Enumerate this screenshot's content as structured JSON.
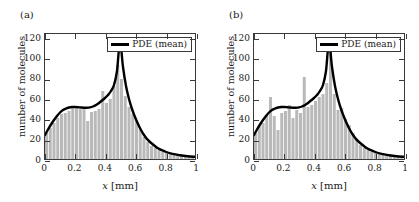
{
  "figure": {
    "background": "#ffffff",
    "bar_color": "#b9b9b9",
    "bar_edge_color": "#ffffff",
    "line_color": "#000000",
    "axis_color": "#3a3a3a"
  },
  "panels": [
    {
      "label": "(a)",
      "legend_label": "PDE (mean)"
    },
    {
      "label": "(b)",
      "legend_label": "PDE (mean)"
    }
  ],
  "chart_data": [
    {
      "type": "bar",
      "panel": "(a)",
      "title": "",
      "xlabel": "x [mm]",
      "ylabel": "number of molecules",
      "xlim": [
        0,
        1
      ],
      "ylim": [
        0,
        125
      ],
      "xticks": [
        0,
        0.2,
        0.4,
        0.6,
        0.8,
        1
      ],
      "xtick_labels": [
        "0",
        "0.2",
        "0.4",
        "0.6",
        "0.8",
        "1"
      ],
      "yticks": [
        0,
        20,
        40,
        60,
        80,
        100,
        120
      ],
      "ytick_labels": [
        "0",
        "20",
        "40",
        "60",
        "80",
        "100",
        "120"
      ],
      "grid": false,
      "legend_position": "top-right",
      "bin_width": 0.025,
      "bin_centers": [
        0.0125,
        0.0375,
        0.0625,
        0.0875,
        0.1125,
        0.1375,
        0.1625,
        0.1875,
        0.2125,
        0.2375,
        0.2625,
        0.2875,
        0.3125,
        0.3375,
        0.3625,
        0.3875,
        0.4125,
        0.4375,
        0.4625,
        0.4875,
        0.5125,
        0.5375,
        0.5625,
        0.5875,
        0.6125,
        0.6375,
        0.6625,
        0.6875,
        0.7125,
        0.7375,
        0.7625,
        0.7875,
        0.8125,
        0.8375,
        0.8625,
        0.8875,
        0.9125,
        0.9375,
        0.9625,
        0.9875
      ],
      "values": [
        26,
        31,
        36,
        41,
        45,
        46,
        48,
        52,
        53,
        50,
        50,
        38,
        47,
        48,
        50,
        68,
        56,
        60,
        73,
        94,
        80,
        63,
        52,
        45,
        38,
        30,
        22,
        17,
        13,
        11,
        9,
        7,
        6,
        6,
        5,
        4,
        4,
        3,
        3,
        3
      ],
      "series": [
        {
          "name": "PDE (mean)",
          "type": "line",
          "x": [
            0.0,
            0.02,
            0.04,
            0.06,
            0.08,
            0.1,
            0.12,
            0.14,
            0.16,
            0.18,
            0.2,
            0.22,
            0.24,
            0.26,
            0.28,
            0.3,
            0.32,
            0.34,
            0.36,
            0.38,
            0.4,
            0.42,
            0.44,
            0.46,
            0.48,
            0.5,
            0.52,
            0.54,
            0.56,
            0.58,
            0.6,
            0.62,
            0.64,
            0.66,
            0.68,
            0.7,
            0.75,
            0.8,
            0.85,
            0.9,
            0.95,
            1.0
          ],
          "y": [
            24,
            29.5,
            34.5,
            39,
            43,
            46.5,
            49,
            50.5,
            51.5,
            52,
            52,
            51.8,
            51.5,
            51.3,
            51.3,
            51.6,
            52.5,
            54,
            56,
            58.5,
            61,
            64,
            68,
            74,
            88,
            117,
            92,
            73,
            60,
            50,
            42,
            35,
            29,
            24,
            20,
            17,
            11,
            7.5,
            5.2,
            3.8,
            2.8,
            2.2
          ]
        }
      ]
    },
    {
      "type": "bar",
      "panel": "(b)",
      "title": "",
      "xlabel": "x [mm]",
      "ylabel": "number of molecules",
      "xlim": [
        0,
        1
      ],
      "ylim": [
        0,
        125
      ],
      "xticks": [
        0,
        0.2,
        0.4,
        0.6,
        0.8,
        1
      ],
      "xtick_labels": [
        "0",
        "0.2",
        "0.4",
        "0.6",
        "0.8",
        "1"
      ],
      "yticks": [
        0,
        20,
        40,
        60,
        80,
        100,
        120
      ],
      "ytick_labels": [
        "0",
        "20",
        "40",
        "60",
        "80",
        "100",
        "120"
      ],
      "grid": false,
      "legend_position": "top-right",
      "bin_width": 0.025,
      "bin_centers": [
        0.0125,
        0.0375,
        0.0625,
        0.0875,
        0.1125,
        0.1375,
        0.1625,
        0.1875,
        0.2125,
        0.2375,
        0.2625,
        0.2875,
        0.3125,
        0.3375,
        0.3625,
        0.3875,
        0.4125,
        0.4375,
        0.4625,
        0.4875,
        0.5125,
        0.5375,
        0.5625,
        0.5875,
        0.6125,
        0.6375,
        0.6625,
        0.6875,
        0.7125,
        0.7375,
        0.7625,
        0.7875,
        0.8125,
        0.8375,
        0.8625,
        0.8875,
        0.9125,
        0.9375,
        0.9625,
        0.9875
      ],
      "values": [
        26,
        33,
        36,
        44,
        62,
        43,
        29,
        46,
        48,
        54,
        41,
        49,
        46,
        82,
        52,
        54,
        58,
        62,
        65,
        76,
        117,
        65,
        49,
        51,
        40,
        34,
        26,
        19,
        14,
        11,
        9,
        7,
        6,
        5,
        5,
        4,
        3,
        3,
        3,
        2
      ],
      "series": [
        {
          "name": "PDE (mean)",
          "type": "line",
          "x": [
            0.0,
            0.02,
            0.04,
            0.06,
            0.08,
            0.1,
            0.12,
            0.14,
            0.16,
            0.18,
            0.2,
            0.22,
            0.24,
            0.26,
            0.28,
            0.3,
            0.32,
            0.34,
            0.36,
            0.38,
            0.4,
            0.42,
            0.44,
            0.46,
            0.48,
            0.5,
            0.52,
            0.54,
            0.56,
            0.58,
            0.6,
            0.62,
            0.64,
            0.66,
            0.68,
            0.7,
            0.75,
            0.8,
            0.85,
            0.9,
            0.95,
            1.0
          ],
          "y": [
            24,
            29.5,
            34.5,
            39,
            43,
            46.5,
            49,
            50.5,
            51.5,
            52,
            52,
            51.8,
            51.5,
            51.3,
            51.3,
            51.6,
            52.5,
            54,
            56,
            58.5,
            61,
            64,
            68,
            74,
            88,
            117,
            92,
            73,
            60,
            50,
            42,
            35,
            29,
            24,
            20,
            17,
            11,
            7.5,
            5.2,
            3.8,
            2.8,
            2.2
          ]
        }
      ]
    }
  ]
}
